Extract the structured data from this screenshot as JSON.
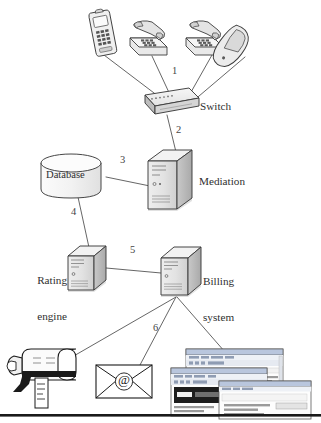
{
  "diagram": {
    "type": "network-architecture-diagram",
    "canvas": {
      "width": 321,
      "height": 423
    },
    "style": {
      "line_color": "#4a4a4a",
      "outline_color": "#3c3c3c",
      "fill_light": "#f4f4f4",
      "fill_mid": "#dcdcdc",
      "fill_dark": "#b8b8b8",
      "text_color": "#2f2f2f",
      "background": "#ffffff"
    },
    "nodes": [
      {
        "id": "mobile-phone",
        "label": "",
        "kind": "mobile-phone-icon"
      },
      {
        "id": "desk-phone-1",
        "label": "",
        "kind": "desk-phone-icon"
      },
      {
        "id": "desk-phone-2",
        "label": "",
        "kind": "desk-phone-icon"
      },
      {
        "id": "cordless-handset",
        "label": "",
        "kind": "cordless-handset-icon"
      },
      {
        "id": "switch",
        "label": "Switch",
        "kind": "switch-icon"
      },
      {
        "id": "mediation",
        "label": "Mediation",
        "kind": "server-tower-icon"
      },
      {
        "id": "database",
        "label": "Database",
        "kind": "database-cylinder-icon"
      },
      {
        "id": "rating-engine",
        "label": "Rating\nengine",
        "label_line1": "Rating",
        "label_line2": "engine",
        "kind": "server-tower-icon"
      },
      {
        "id": "billing-system",
        "label": "Billing\nsystem",
        "label_line1": "Billing",
        "label_line2": "system",
        "kind": "server-tower-icon"
      },
      {
        "id": "mailbox",
        "label": "",
        "kind": "mailbox-icon"
      },
      {
        "id": "email-envelope",
        "label": "@",
        "kind": "envelope-at-icon"
      },
      {
        "id": "web-portal",
        "label": "",
        "kind": "browser-windows-icon"
      }
    ],
    "connections": [
      {
        "number": "1",
        "from": "phones",
        "to": "switch"
      },
      {
        "number": "2",
        "from": "switch",
        "to": "mediation"
      },
      {
        "number": "3",
        "from": "mediation",
        "to": "database"
      },
      {
        "number": "4",
        "from": "database",
        "to": "rating-engine"
      },
      {
        "number": "5",
        "from": "rating-engine",
        "to": "billing-system"
      },
      {
        "number": "6",
        "from": "billing-system",
        "to": "delivery-channels"
      }
    ]
  },
  "labels": {
    "switch": "Switch",
    "mediation": "Mediation",
    "database": "Database",
    "rating_line1": "Rating",
    "rating_line2": "engine",
    "billing_line1": "Billing",
    "billing_line2": "system",
    "n1": "1",
    "n2": "2",
    "n3": "3",
    "n4": "4",
    "n5": "5",
    "n6": "6",
    "at_symbol": "@"
  }
}
